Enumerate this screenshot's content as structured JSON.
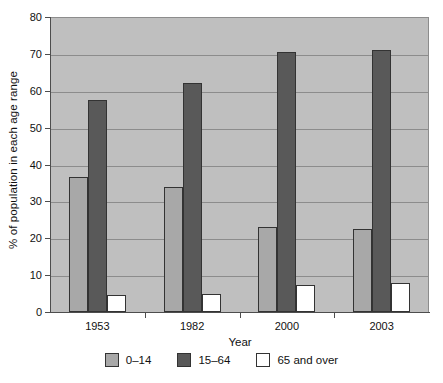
{
  "chart_data": {
    "type": "bar",
    "title": "",
    "xlabel": "Year",
    "ylabel": "% of population in each age range",
    "categories": [
      "1953",
      "1982",
      "2000",
      "2003"
    ],
    "series": [
      {
        "name": "0–14",
        "color": "#a8a8a8",
        "values": [
          36.5,
          34.0,
          23.0,
          22.5
        ]
      },
      {
        "name": "15–64",
        "color": "#595959",
        "values": [
          57.5,
          62.0,
          70.5,
          71.0
        ]
      },
      {
        "name": "65 and over",
        "color": "#ffffff",
        "values": [
          4.5,
          5.0,
          7.2,
          8.0
        ]
      }
    ],
    "ylim": [
      0,
      80
    ],
    "ytick_step": 10,
    "yticks": [
      "0",
      "10",
      "20",
      "30",
      "40",
      "50",
      "60",
      "70",
      "80"
    ],
    "grid": true,
    "legend_position": "bottom",
    "plot_background": "#bfbfbf",
    "gridline_color": "#8c8c8c",
    "axis_color": "#4d4d4d"
  }
}
